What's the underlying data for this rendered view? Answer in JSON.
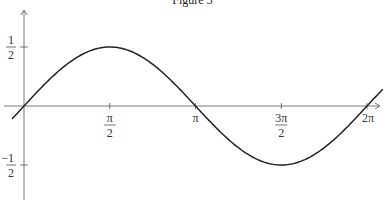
{
  "chart_data": {
    "type": "line",
    "title": "Figure 3",
    "xlabel": "",
    "ylabel": "",
    "function": "y = 0.5 * sin(x)",
    "series": [
      {
        "name": "0.5 sin(x)",
        "x": [
          -0.22,
          0,
          0.785,
          1.571,
          2.356,
          3.142,
          3.927,
          4.712,
          5.498,
          6.283,
          6.57
        ],
        "values": [
          -0.109,
          0,
          0.354,
          0.5,
          0.354,
          0,
          -0.354,
          -0.5,
          -0.354,
          0,
          0.14
        ]
      }
    ],
    "x_ticks": [
      {
        "value": 1.5708,
        "num": "π",
        "den": "2"
      },
      {
        "value": 3.1416,
        "num": "π",
        "den": ""
      },
      {
        "value": 4.7124,
        "num": "3π",
        "den": "2"
      },
      {
        "value": 6.2832,
        "num": "2π",
        "den": ""
      }
    ],
    "y_ticks": [
      {
        "value": 0.5,
        "num": "1",
        "den": "2",
        "sign": ""
      },
      {
        "value": -0.5,
        "num": "1",
        "den": "2",
        "sign": "−"
      }
    ],
    "xlim": [
      -0.22,
      6.57
    ],
    "ylim": [
      -0.8,
      0.82
    ],
    "grid": false,
    "legend": "none",
    "line_color": "#222222",
    "axis_color": "#555555"
  }
}
